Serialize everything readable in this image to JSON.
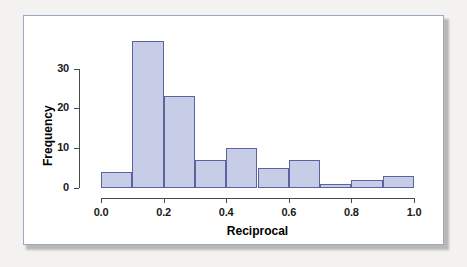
{
  "figure": {
    "background_color": "#ffffff",
    "border_color": "#9aa8c4",
    "page_color": "#f3f2f0"
  },
  "chart_data": {
    "type": "bar",
    "subtype": "histogram",
    "title": "",
    "xlabel": "Reciprocal",
    "ylabel": "Frequency",
    "bin_width": 0.1,
    "bin_edges": [
      0.0,
      0.1,
      0.2,
      0.3,
      0.4,
      0.5,
      0.6,
      0.7,
      0.8,
      0.9,
      1.0
    ],
    "categories": [
      "0.0-0.1",
      "0.1-0.2",
      "0.2-0.3",
      "0.3-0.4",
      "0.4-0.5",
      "0.5-0.6",
      "0.6-0.7",
      "0.7-0.8",
      "0.8-0.9",
      "0.9-1.0"
    ],
    "values": [
      4,
      37,
      23,
      7,
      10,
      5,
      7,
      1,
      2,
      3
    ],
    "bar_fill_color": "#c7cde6",
    "bar_border_color": "#5a63a0",
    "xlim": [
      0.0,
      1.0
    ],
    "ylim": [
      0,
      40
    ],
    "xticks": [
      0.0,
      0.2,
      0.4,
      0.6,
      0.8,
      1.0
    ],
    "xtick_labels": [
      "0.0",
      "0.2",
      "0.4",
      "0.6",
      "0.8",
      "1.0"
    ],
    "yticks": [
      0,
      10,
      20,
      30
    ],
    "ytick_labels": [
      "0",
      "10",
      "20",
      "30"
    ],
    "grid": false,
    "legend": null
  }
}
